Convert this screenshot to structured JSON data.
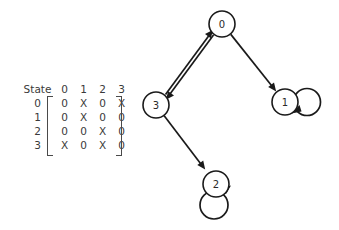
{
  "figure": {
    "background_color": "#ffffff",
    "ink_color": "#1a1a1a",
    "text_color": "#3a3a3a"
  },
  "matrix": {
    "corner_label": "State",
    "column_headers": [
      "0",
      "1",
      "2",
      "3"
    ],
    "row_headers": [
      "0",
      "1",
      "2",
      "3"
    ],
    "rows": [
      [
        "0",
        "X",
        "0",
        "X"
      ],
      [
        "0",
        "X",
        "0",
        "0"
      ],
      [
        "0",
        "0",
        "X",
        "0"
      ],
      [
        "X",
        "0",
        "X",
        "0"
      ]
    ]
  },
  "graph": {
    "nodes": [
      {
        "id": "0",
        "label": "0",
        "cx": 222,
        "cy": 24,
        "r": 13
      },
      {
        "id": "1",
        "label": "1",
        "cx": 285,
        "cy": 102,
        "r": 13
      },
      {
        "id": "2",
        "label": "2",
        "cx": 216,
        "cy": 184,
        "r": 13
      },
      {
        "id": "3",
        "label": "3",
        "cx": 156,
        "cy": 105,
        "r": 13
      }
    ],
    "edges": [
      {
        "from": "3",
        "to": "0",
        "kind": "directed"
      },
      {
        "from": "0",
        "to": "3",
        "kind": "directed"
      },
      {
        "from": "0",
        "to": "1",
        "kind": "directed"
      },
      {
        "from": "3",
        "to": "2",
        "kind": "directed"
      },
      {
        "from": "1",
        "to": "1",
        "kind": "self-loop"
      },
      {
        "from": "2",
        "to": "2",
        "kind": "self-loop"
      }
    ]
  }
}
